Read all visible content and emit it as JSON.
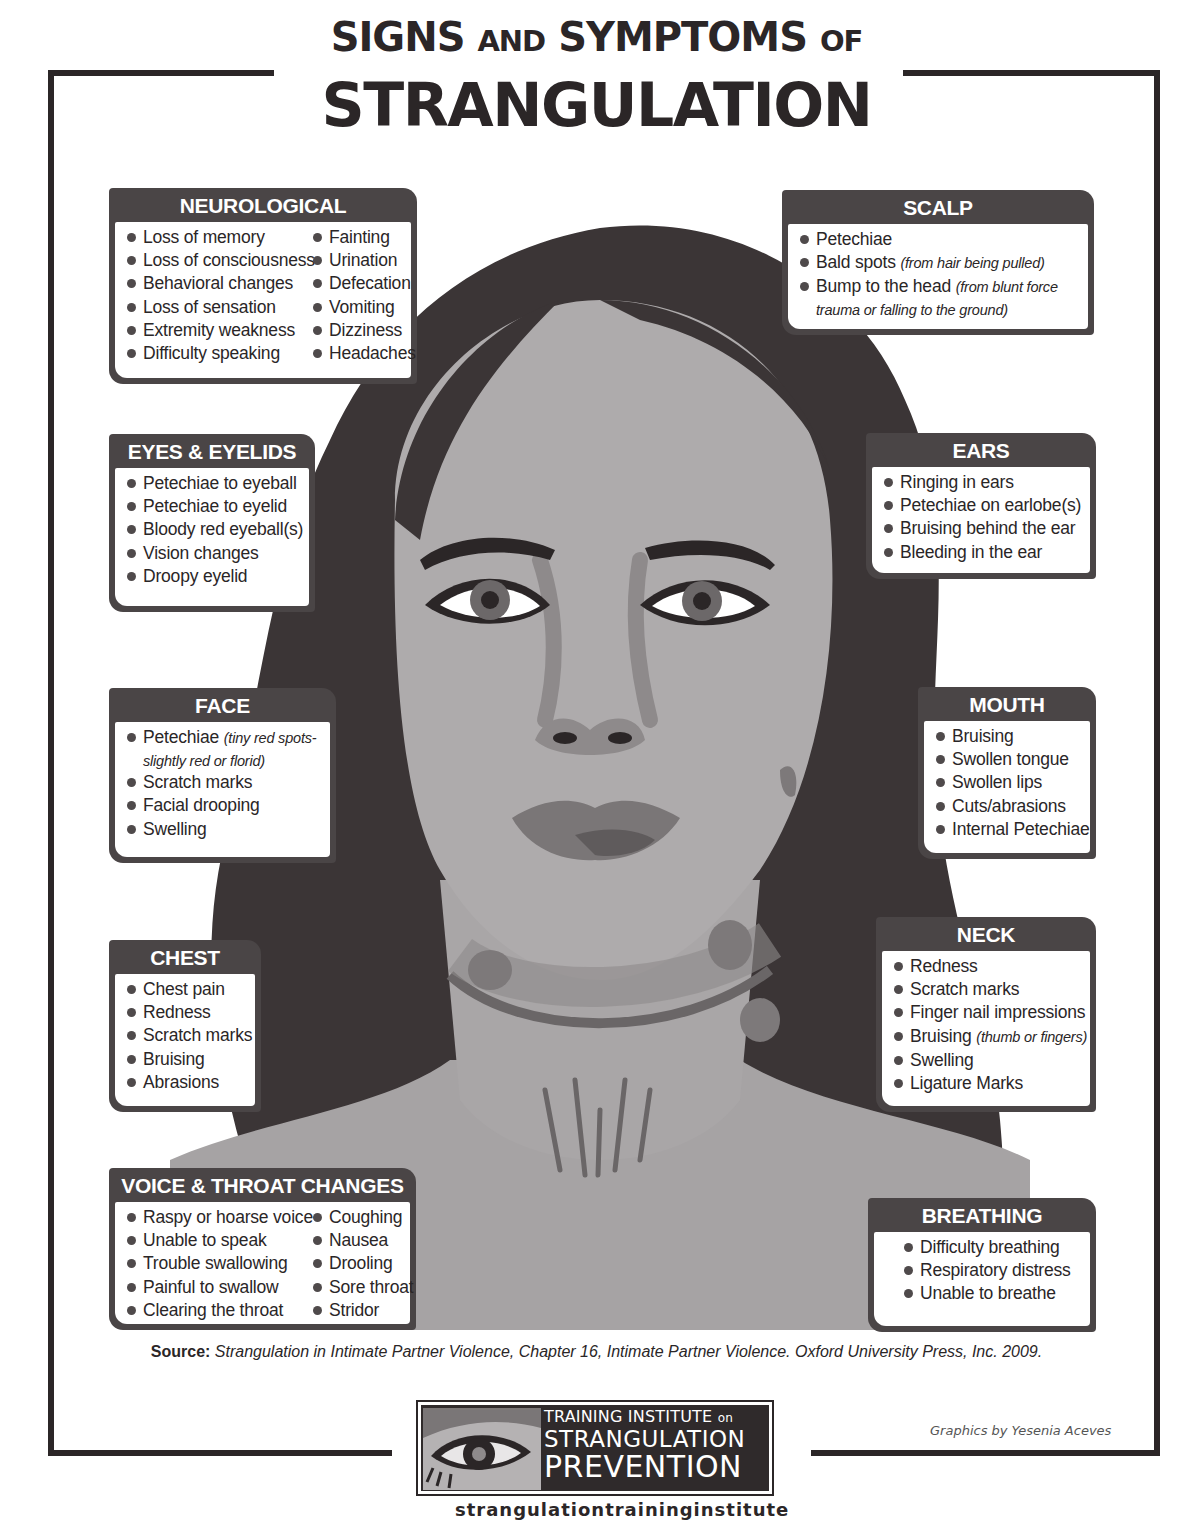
{
  "title": {
    "line1_big_a": "SIGNS",
    "line1_small_a": "AND",
    "line1_big_b": "SYMPTOMS",
    "line1_small_b": "OF",
    "line2": "STRANGULATION"
  },
  "palette": {
    "frame": "#2b2627",
    "box_header": "#4a4546",
    "hair": "#3b3536",
    "skin": "#a9a6a7",
    "shadow": "#8c8889",
    "background": "#ffffff"
  },
  "sections": {
    "neurological": {
      "heading": "NEUROLOGICAL",
      "col1": [
        "Loss of memory",
        "Loss of consciousness",
        "Behavioral changes",
        "Loss of sensation",
        "Extremity weakness",
        "Difficulty speaking"
      ],
      "col2": [
        "Fainting",
        "Urination",
        "Defecation",
        "Vomiting",
        "Dizziness",
        "Headaches"
      ]
    },
    "scalp": {
      "heading": "SCALP",
      "items": [
        {
          "text": "Petechiae",
          "note": ""
        },
        {
          "text": "Bald spots ",
          "note": "(from hair being pulled)"
        },
        {
          "text": "Bump to the head ",
          "note": "(from blunt force"
        },
        {
          "text": "",
          "note": "trauma or falling to the ground)"
        }
      ]
    },
    "eyes": {
      "heading": "EYES & EYELIDS",
      "items": [
        "Petechiae to eyeball",
        "Petechiae to eyelid",
        "Bloody red eyeball(s)",
        "Vision changes",
        "Droopy eyelid"
      ]
    },
    "ears": {
      "heading": "EARS",
      "items": [
        "Ringing in ears",
        "Petechiae on earlobe(s)",
        "Bruising behind the ear",
        "Bleeding in the ear"
      ]
    },
    "face": {
      "heading": "FACE",
      "items": [
        {
          "text": "Petechiae ",
          "note": "(tiny red spots-"
        },
        {
          "text": "",
          "note": "slightly red or florid)"
        },
        {
          "text": "Scratch marks",
          "note": ""
        },
        {
          "text": "Facial drooping",
          "note": ""
        },
        {
          "text": "Swelling",
          "note": ""
        }
      ]
    },
    "mouth": {
      "heading": "MOUTH",
      "items": [
        "Bruising",
        "Swollen tongue",
        "Swollen lips",
        "Cuts/abrasions",
        "Internal Petechiae"
      ]
    },
    "chest": {
      "heading": "CHEST",
      "items": [
        "Chest pain",
        "Redness",
        "Scratch marks",
        "Bruising",
        "Abrasions"
      ]
    },
    "neck": {
      "heading": "NECK",
      "items": [
        {
          "text": "Redness",
          "note": ""
        },
        {
          "text": "Scratch marks",
          "note": ""
        },
        {
          "text": "Finger nail impressions",
          "note": ""
        },
        {
          "text": "Bruising ",
          "note": "(thumb or fingers)"
        },
        {
          "text": "Swelling",
          "note": ""
        },
        {
          "text": "Ligature Marks",
          "note": ""
        }
      ]
    },
    "voice": {
      "heading": "VOICE & THROAT CHANGES",
      "col1": [
        "Raspy or hoarse voice",
        "Unable to speak",
        "Trouble swallowing",
        "Painful to swallow",
        "Clearing the throat"
      ],
      "col2": [
        "Coughing",
        "Nausea",
        "Drooling",
        "Sore throat",
        "Stridor"
      ]
    },
    "breathing": {
      "heading": "BREATHING CHANGES",
      "items": [
        "Difficulty breathing",
        "Respiratory distress",
        "Unable to breathe"
      ]
    }
  },
  "source": {
    "label": "Source:",
    "text": " Strangulation in Intimate Partner Violence, Chapter 16, Intimate Partner Violence. Oxford University Press, Inc. 2009."
  },
  "logo": {
    "line1": "TRAINING INSTITUTE",
    "line1_small": "on",
    "line2": "STRANGULATION",
    "line3": "PREVENTION",
    "icon": "eye-icon"
  },
  "credit": "Graphics by Yesenia Aceves",
  "url_partial": "strangulationtraininginstitute"
}
